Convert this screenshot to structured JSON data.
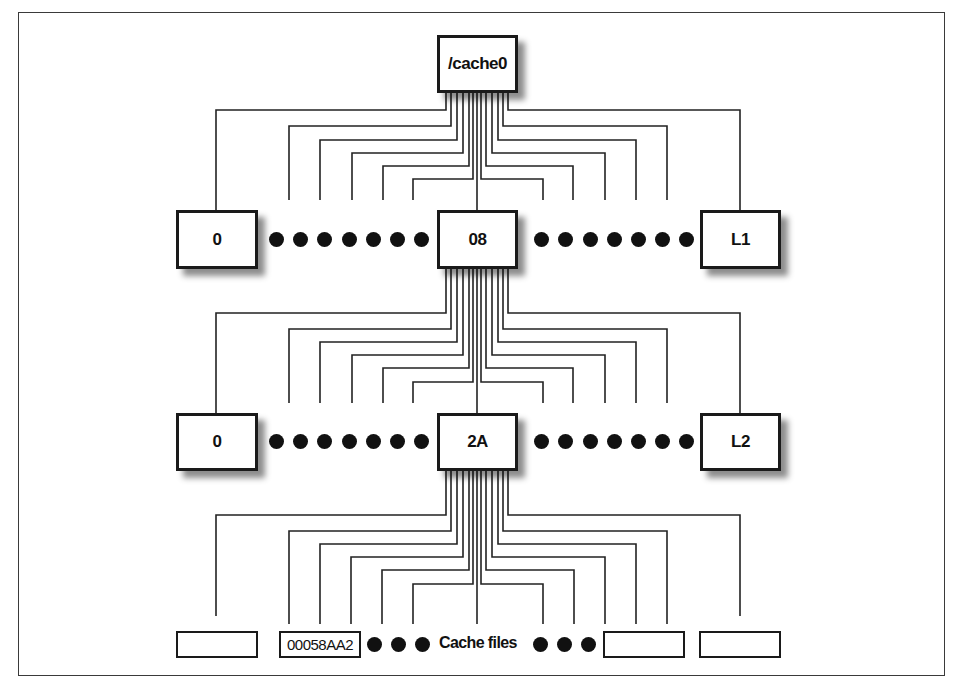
{
  "diagram": {
    "type": "directory-tree",
    "root": {
      "label": "/cache0"
    },
    "level1": {
      "first": "0",
      "middle": "08",
      "last": "L1"
    },
    "level2": {
      "first": "0",
      "middle": "2A",
      "last": "L2"
    },
    "files": {
      "first": "",
      "named": "00058AA2",
      "caption": "Cache files",
      "third": "",
      "last": ""
    },
    "ellipsis_dots": {
      "level1_left": 7,
      "level1_right": 7,
      "level2_left": 7,
      "level2_right": 7,
      "files_left": 3,
      "files_right": 3
    },
    "colors": {
      "line": "#1a1a1a",
      "background": "#ffffff"
    }
  }
}
